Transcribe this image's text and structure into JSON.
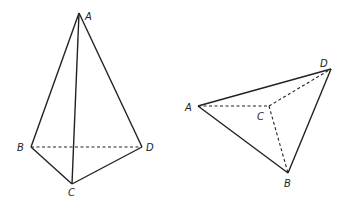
{
  "figures": [
    {
      "name": "tetrahedron-left",
      "vertices": {
        "A": {
          "label": "A",
          "x": 79,
          "y": 13
        },
        "B": {
          "label": "B",
          "x": 31,
          "y": 147
        },
        "C": {
          "label": "C",
          "x": 72,
          "y": 184
        },
        "D": {
          "label": "D",
          "x": 142,
          "y": 147
        }
      },
      "solid_edges": [
        [
          "A",
          "B"
        ],
        [
          "A",
          "C"
        ],
        [
          "A",
          "D"
        ],
        [
          "B",
          "C"
        ],
        [
          "C",
          "D"
        ]
      ],
      "dashed_edges": [
        [
          "B",
          "D"
        ]
      ]
    },
    {
      "name": "tetrahedron-right",
      "vertices": {
        "A": {
          "label": "A",
          "x": 198,
          "y": 106
        },
        "B": {
          "label": "B",
          "x": 288,
          "y": 173
        },
        "C": {
          "label": "C",
          "x": 269,
          "y": 106
        },
        "D": {
          "label": "D",
          "x": 331,
          "y": 69
        }
      },
      "solid_edges": [
        [
          "A",
          "D"
        ],
        [
          "A",
          "B"
        ],
        [
          "B",
          "D"
        ]
      ],
      "dashed_edges": [
        [
          "A",
          "C"
        ],
        [
          "C",
          "D"
        ],
        [
          "C",
          "B"
        ]
      ]
    }
  ],
  "labels": {
    "left": {
      "A": "A",
      "B": "B",
      "C": "C",
      "D": "D"
    },
    "right": {
      "A": "A",
      "B": "B",
      "C": "C",
      "D": "D"
    }
  }
}
